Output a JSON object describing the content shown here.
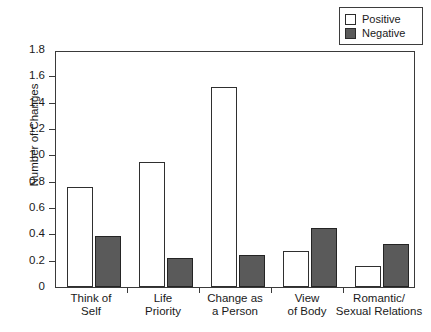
{
  "chart_data": {
    "type": "bar",
    "title": "",
    "xlabel": "",
    "ylabel": "Number of Changes",
    "ylim": [
      0,
      1.8
    ],
    "ytick_labels": [
      "0",
      "0.2",
      "0.4",
      "0.6",
      "0.8",
      "1.0",
      "1.2",
      "1.4",
      "1.6",
      "1.8"
    ],
    "ytick_values": [
      0,
      0.2,
      0.4,
      0.6,
      0.8,
      1.0,
      1.2,
      1.4,
      1.6,
      1.8
    ],
    "grid": false,
    "legend_position": "top-right",
    "categories": [
      "Think of Self",
      "Life Priority",
      "Change as a Person",
      "View of Body",
      "Romantic/ Sexual Relations"
    ],
    "category_lines": [
      [
        "Think of",
        "Self"
      ],
      [
        "Life",
        "Priority"
      ],
      [
        "Change as",
        "a Person"
      ],
      [
        "View",
        "of Body"
      ],
      [
        "Romantic/",
        "Sexual Relations"
      ]
    ],
    "series": [
      {
        "name": "Positive",
        "color": "#ffffff",
        "values": [
          0.76,
          0.95,
          1.52,
          0.27,
          0.16
        ]
      },
      {
        "name": "Negative",
        "color": "#5a5a5a",
        "values": [
          0.39,
          0.22,
          0.24,
          0.45,
          0.33
        ]
      }
    ]
  },
  "legend": {
    "items": [
      {
        "label": "Positive",
        "swatch": "positive-swatch"
      },
      {
        "label": "Negative",
        "swatch": "negative-swatch"
      }
    ]
  },
  "colors": {
    "positive_fill": "#ffffff",
    "negative_fill": "#5a5a5a",
    "axis": "#3a3a3a",
    "background": "#ffffff"
  }
}
